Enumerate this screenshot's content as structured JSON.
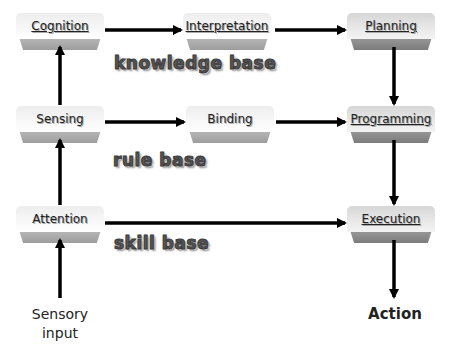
{
  "nodes": {
    "cognition": "Cognition",
    "interpretation": "Interpretation",
    "planning": "Planning",
    "sensing": "Sensing",
    "binding": "Binding",
    "programming": "Programming",
    "attention": "Attention",
    "execution": "Execution"
  },
  "bases": {
    "knowledge": "knowledge base",
    "rule": "rule base",
    "skill": "skill base"
  },
  "io": {
    "input_line1": "Sensory",
    "input_line2": "input",
    "output": "Action"
  },
  "colors": {
    "arrow": "#000000",
    "box_top_light": "#f5f5f5",
    "box_bottom_light": "#a8a8a8",
    "box_top_dark": "#e2e2e2",
    "box_bottom_dark": "#8a8a8a"
  }
}
